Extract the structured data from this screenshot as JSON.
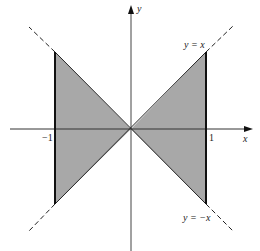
{
  "figure": {
    "type": "region-diagram",
    "colors": {
      "shade": "#a8a8a8",
      "axis": "#333333",
      "boundary": "#111111",
      "dashed": "#222222",
      "background": "#ffffff"
    }
  },
  "axes": {
    "x_label": "x",
    "y_label": "y",
    "ticks": {
      "neg_one": "−1",
      "pos_one": "1"
    }
  },
  "curves": {
    "line1_label": "y = x",
    "line2_label": "y = −x"
  },
  "geometry": {
    "origin_px": [
      131,
      129
    ],
    "unit_px": 75,
    "x_range": [
      -1,
      1
    ],
    "boundaries": [
      "x = -1",
      "x = 1"
    ]
  }
}
